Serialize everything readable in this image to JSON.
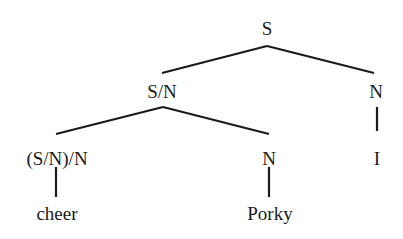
{
  "diagram": {
    "type": "syntax-tree",
    "nodes": {
      "root": {
        "label": "S",
        "x": 267,
        "y": 28
      },
      "sn": {
        "label": "S/N",
        "x": 162,
        "y": 91
      },
      "n_right": {
        "label": "N",
        "x": 376,
        "y": 91
      },
      "snn": {
        "label": "(S/N)/N",
        "x": 57,
        "y": 158
      },
      "n_mid": {
        "label": "N",
        "x": 269,
        "y": 158
      },
      "i": {
        "label": "I",
        "x": 377,
        "y": 158
      },
      "cheer": {
        "label": "cheer",
        "x": 57,
        "y": 213
      },
      "porky": {
        "label": "Porky",
        "x": 270,
        "y": 213
      }
    },
    "edges": [
      {
        "from": "root",
        "to": "sn"
      },
      {
        "from": "root",
        "to": "n_right"
      },
      {
        "from": "sn",
        "to": "snn"
      },
      {
        "from": "sn",
        "to": "n_mid"
      },
      {
        "from": "n_right",
        "to": "i"
      },
      {
        "from": "snn",
        "to": "cheer"
      },
      {
        "from": "n_mid",
        "to": "porky"
      }
    ]
  },
  "colors": {
    "ink": "#1a1a1a",
    "background": "#ffffff"
  }
}
